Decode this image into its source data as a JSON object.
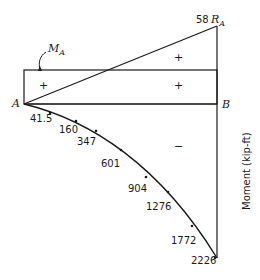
{
  "diagram": {
    "axis_label": "Moment (kip-ft)",
    "points": {
      "left": "A",
      "right": "B",
      "applied_moment": "M",
      "applied_moment_sub": "A",
      "reaction": "R",
      "reaction_sub": "A"
    },
    "reaction_value": "58",
    "signs": {
      "upper_triangle": "+",
      "rect_left": "+",
      "rect_right": "+",
      "lower_region": "−"
    },
    "curve_labels": [
      "41.5",
      "160",
      "347",
      "601",
      "904",
      "1276",
      "1772",
      "2226"
    ],
    "line_color": "#1a1a1a"
  }
}
